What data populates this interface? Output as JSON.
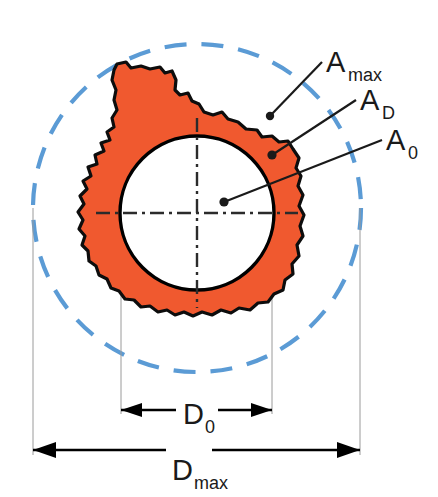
{
  "figure": {
    "type": "technical-diagram",
    "background_color": "#ffffff"
  },
  "colors": {
    "particle_fill": "#f0592f",
    "particle_outline": "#0d0d0d",
    "max_circle": "#5b9bd5",
    "inner_circle": "#000000",
    "centerline": "#2b2b2b",
    "extension_line": "#8c8c8c",
    "dimension_line": "#000000",
    "leader_line": "#1a1a1a",
    "label_text": "#1a1a1a"
  },
  "labels": {
    "a_max": {
      "base": "A",
      "sub": "max"
    },
    "a_d": {
      "base": "A",
      "sub": "D"
    },
    "a_zero": {
      "base": "A",
      "sub": "0"
    },
    "d_zero": {
      "base": "D",
      "sub": "0"
    },
    "d_max": {
      "base": "D",
      "sub": "max"
    }
  },
  "geometry": {
    "max_circle": {
      "cx": 197,
      "cy": 208,
      "r": 164,
      "dashed": true
    },
    "inner_circle": {
      "cx": 197,
      "cy": 213,
      "r": 77
    },
    "center_point": {
      "cx": 197,
      "cy": 213
    },
    "horizontal_centerline": {
      "x1": 96,
      "x2": 298,
      "y": 213
    },
    "vertical_centerline": {
      "x": 197,
      "y1": 118,
      "y2": 308
    },
    "d_zero_dimension": {
      "x1": 121,
      "x2": 272,
      "y": 410
    },
    "d_max_dimension": {
      "x1": 33,
      "x2": 360,
      "y": 450
    }
  },
  "leaders": [
    {
      "name": "a-max-leader",
      "label": "a_max",
      "dot_x": 270,
      "dot_y": 116,
      "end_x": 322,
      "end_y": 62
    },
    {
      "name": "a-d-leader",
      "label": "a_d",
      "dot_x": 272,
      "dot_y": 155,
      "end_x": 356,
      "end_y": 100
    },
    {
      "name": "a-zero-leader",
      "label": "a_zero",
      "dot_x": 224,
      "dot_y": 202,
      "end_x": 382,
      "end_y": 140
    }
  ],
  "label_positions": {
    "a_max": {
      "x": 326,
      "y": 72,
      "sub_dx": 22,
      "sub_dy": 9
    },
    "a_d": {
      "x": 360,
      "y": 110,
      "sub_dx": 22,
      "sub_dy": 9
    },
    "a_zero": {
      "x": 386,
      "y": 150,
      "sub_dx": 22,
      "sub_dy": 9
    },
    "d_zero": {
      "x": 183,
      "y": 424,
      "sub_dx": 22,
      "sub_dy": 9
    },
    "d_max": {
      "x": 172,
      "y": 480,
      "sub_dx": 22,
      "sub_dy": 9
    }
  }
}
